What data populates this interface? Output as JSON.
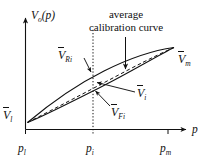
{
  "figure": {
    "axes": {
      "y_label_main": "V",
      "y_label_sub": "o",
      "y_label_arg": "(p)",
      "x_label": "p"
    },
    "annotation": {
      "line1": "average",
      "line2": "calibration curve"
    },
    "points": [
      {
        "id": "v-lower",
        "symbol": "V",
        "subscript": "l",
        "name": "lower-limit-voltage"
      },
      {
        "id": "v-max",
        "symbol": "V",
        "subscript": "m",
        "name": "max-voltage"
      },
      {
        "id": "v-reverse",
        "symbol": "V",
        "subscript": "Ri",
        "name": "reverse-voltage-at-pi"
      },
      {
        "id": "v-average",
        "symbol": "V",
        "subscript": "i",
        "name": "average-voltage-at-pi"
      },
      {
        "id": "v-forward",
        "symbol": "V",
        "subscript": "Fi",
        "name": "forward-voltage-at-pi"
      }
    ],
    "ticks": [
      {
        "id": "p-lower",
        "symbol": "p",
        "subscript": "l",
        "name": "pressure-lower"
      },
      {
        "id": "p-i",
        "symbol": "p",
        "subscript": "i",
        "name": "pressure-i"
      },
      {
        "id": "p-max",
        "symbol": "p",
        "subscript": "m",
        "name": "pressure-max"
      }
    ],
    "colors": {
      "stroke": "#111111",
      "background": "#ffffff"
    }
  }
}
